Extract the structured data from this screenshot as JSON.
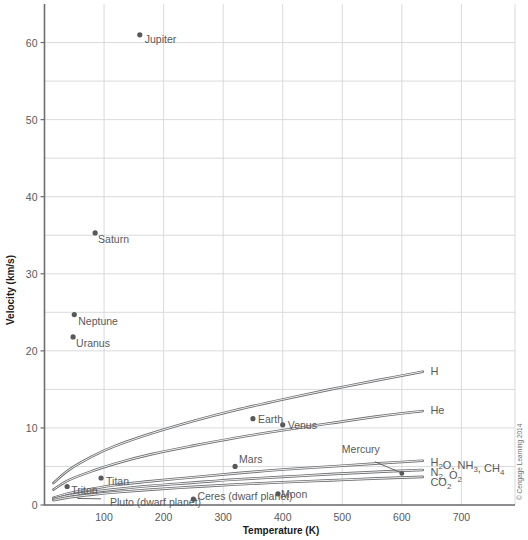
{
  "chart_data": {
    "type": "line",
    "title": "",
    "xlabel": "Temperature (K)",
    "ylabel": "Velocity (km/s)",
    "xlim": [
      0,
      790
    ],
    "ylim": [
      0,
      65
    ],
    "xticks": [
      100,
      200,
      300,
      400,
      500,
      600,
      700
    ],
    "yticks": [
      0,
      10,
      20,
      30,
      40,
      50,
      60
    ],
    "xtick_labels": [
      "100",
      "200",
      "300",
      "400",
      "500",
      "600",
      "700"
    ],
    "ytick_labels": [
      "0",
      "10",
      "20",
      "30",
      "40",
      "50",
      "60"
    ],
    "grid": true,
    "minor_grid_y": true,
    "legend": "inline-curve-labels",
    "series": [
      {
        "name": "H2",
        "label": "H",
        "label_sub": "2",
        "label_x": 648,
        "label_y": 17.4,
        "points": [
          {
            "x": 15,
            "y": 2.85
          },
          {
            "x": 40,
            "y": 4.5
          },
          {
            "x": 80,
            "y": 6.3
          },
          {
            "x": 120,
            "y": 7.7
          },
          {
            "x": 180,
            "y": 9.3
          },
          {
            "x": 250,
            "y": 10.9
          },
          {
            "x": 320,
            "y": 12.3
          },
          {
            "x": 400,
            "y": 13.7
          },
          {
            "x": 480,
            "y": 15.0
          },
          {
            "x": 560,
            "y": 16.2
          },
          {
            "x": 635,
            "y": 17.3
          }
        ]
      },
      {
        "name": "He",
        "label": "He",
        "label_sub": "",
        "label_x": 648,
        "label_y": 12.3,
        "points": [
          {
            "x": 15,
            "y": 2.0
          },
          {
            "x": 40,
            "y": 3.2
          },
          {
            "x": 80,
            "y": 4.4
          },
          {
            "x": 120,
            "y": 5.4
          },
          {
            "x": 180,
            "y": 6.6
          },
          {
            "x": 250,
            "y": 7.7
          },
          {
            "x": 320,
            "y": 8.7
          },
          {
            "x": 400,
            "y": 9.7
          },
          {
            "x": 480,
            "y": 10.6
          },
          {
            "x": 560,
            "y": 11.5
          },
          {
            "x": 635,
            "y": 12.2
          }
        ]
      },
      {
        "name": "H2O, NH3, CH4",
        "label": "H2O, NH3, CH4",
        "label_x": 648,
        "label_y": 5.6,
        "points": [
          {
            "x": 15,
            "y": 0.95
          },
          {
            "x": 40,
            "y": 1.5
          },
          {
            "x": 80,
            "y": 2.1
          },
          {
            "x": 120,
            "y": 2.6
          },
          {
            "x": 180,
            "y": 3.1
          },
          {
            "x": 250,
            "y": 3.6
          },
          {
            "x": 320,
            "y": 4.1
          },
          {
            "x": 400,
            "y": 4.6
          },
          {
            "x": 480,
            "y": 5.0
          },
          {
            "x": 560,
            "y": 5.4
          },
          {
            "x": 635,
            "y": 5.75
          }
        ]
      },
      {
        "name": "N2, O2",
        "label": "N2, O2",
        "label_x": 648,
        "label_y": 4.3,
        "points": [
          {
            "x": 15,
            "y": 0.78
          },
          {
            "x": 40,
            "y": 1.22
          },
          {
            "x": 80,
            "y": 1.7
          },
          {
            "x": 120,
            "y": 2.05
          },
          {
            "x": 180,
            "y": 2.5
          },
          {
            "x": 250,
            "y": 2.9
          },
          {
            "x": 320,
            "y": 3.3
          },
          {
            "x": 400,
            "y": 3.65
          },
          {
            "x": 480,
            "y": 4.0
          },
          {
            "x": 560,
            "y": 4.3
          },
          {
            "x": 635,
            "y": 4.55
          }
        ]
      },
      {
        "name": "CO2",
        "label": "CO2",
        "label_x": 648,
        "label_y": 3.0,
        "points": [
          {
            "x": 15,
            "y": 0.62
          },
          {
            "x": 40,
            "y": 0.98
          },
          {
            "x": 80,
            "y": 1.35
          },
          {
            "x": 120,
            "y": 1.65
          },
          {
            "x": 180,
            "y": 2.0
          },
          {
            "x": 250,
            "y": 2.35
          },
          {
            "x": 320,
            "y": 2.65
          },
          {
            "x": 400,
            "y": 2.95
          },
          {
            "x": 480,
            "y": 3.2
          },
          {
            "x": 560,
            "y": 3.45
          },
          {
            "x": 635,
            "y": 3.65
          }
        ]
      }
    ],
    "scatter_points": [
      {
        "name": "Jupiter",
        "x": 160,
        "y": 61.0,
        "label": "Jupiter",
        "label_dx": 5,
        "label_dy": 8
      },
      {
        "name": "Saturn",
        "x": 85,
        "y": 35.3,
        "label": "Saturn",
        "label_dx": 3,
        "label_dy": 10
      },
      {
        "name": "Neptune",
        "x": 50,
        "y": 24.7,
        "label": "Neptune",
        "label_dx": 4,
        "label_dy": 10
      },
      {
        "name": "Uranus",
        "x": 48,
        "y": 21.8,
        "label": "Uranus",
        "label_dx": 3,
        "label_dy": 10
      },
      {
        "name": "Earth",
        "x": 350,
        "y": 11.2,
        "label": "Earth",
        "label_dx": 5,
        "label_dy": 4
      },
      {
        "name": "Venus",
        "x": 400,
        "y": 10.4,
        "label": "Venus",
        "label_dx": 5,
        "label_dy": 4
      },
      {
        "name": "Mars",
        "x": 320,
        "y": 5.0,
        "label": "Mars",
        "label_dx": 4,
        "label_dy": -3
      },
      {
        "name": "Titan",
        "x": 95,
        "y": 3.5,
        "label": "Titan",
        "label_dx": 5,
        "label_dy": 7
      },
      {
        "name": "Triton",
        "x": 38,
        "y": 2.4,
        "label": "Triton",
        "label_dx": 4,
        "label_dy": 7
      },
      {
        "name": "Moon",
        "x": 392,
        "y": 1.45,
        "label": "Moon",
        "label_dx": 3,
        "label_dy": 4
      },
      {
        "name": "Ceres",
        "x": 250,
        "y": 0.75,
        "label": "Ceres (dwarf planet)",
        "label_dx": 4,
        "label_dy": 1
      },
      {
        "name": "Mercury",
        "x": 600,
        "y": 4.1,
        "label": "Mercury",
        "label_dx": -60,
        "label_dy": -20
      }
    ],
    "annotations": [
      {
        "name": "pluto",
        "label": "Pluto (dwarf planet)",
        "x": 110,
        "y": 0.45,
        "leader_from_x": 95,
        "leader_from_y": 0.8,
        "leader_to_x": 55,
        "leader_to_y": 0.85
      },
      {
        "name": "mercury-leader",
        "label": "",
        "leader_from_x": 555,
        "leader_from_y": 5.6,
        "leader_to_x": 600,
        "leader_to_y": 4.15
      }
    ]
  },
  "credit": "© Cengage Learning 2014"
}
